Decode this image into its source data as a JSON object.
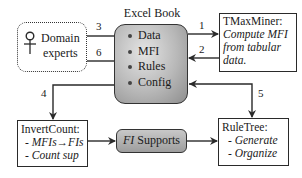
{
  "domain_experts": {
    "label_line1": "Domain",
    "label_line2": "experts",
    "icon": "person-icon"
  },
  "excel_book": {
    "title": "Excel Book",
    "items": [
      "Data",
      "MFI",
      "Rules",
      "Config"
    ]
  },
  "tmaxminer": {
    "title": "TMaxMiner:",
    "lines": [
      "Compute MFI",
      "from tabular",
      "data."
    ]
  },
  "invertcount": {
    "title": "InvertCount:",
    "lines": [
      "- MFIs→FIs",
      "- Count sup"
    ]
  },
  "fi_supports": {
    "fi": "FI",
    "label": " Supports"
  },
  "ruletree": {
    "title": "RuleTree:",
    "lines": [
      "- Generate",
      "- Organize"
    ]
  },
  "arrows": {
    "a1": "1",
    "a2": "2",
    "a3": "3",
    "a4": "4",
    "a5": "5",
    "a6": "6"
  },
  "colors": {
    "excel_fill": "#b8b8b8",
    "stroke": "#2a2a2a",
    "fi_fill": "#aaaaaa"
  }
}
